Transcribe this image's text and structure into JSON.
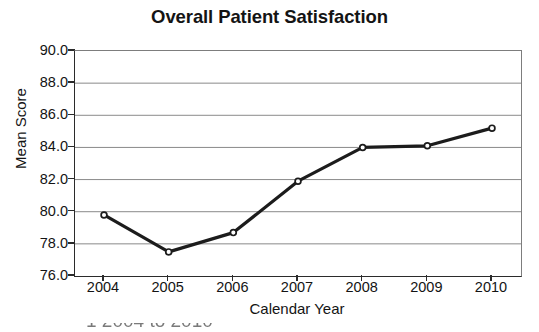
{
  "chart_data": {
    "type": "line",
    "title": "Overall Patient Satisfaction",
    "xlabel": "Calendar Year",
    "ylabel": "Mean Score",
    "categories": [
      "2004",
      "2005",
      "2006",
      "2007",
      "2008",
      "2009",
      "2010"
    ],
    "x": [
      2004,
      2005,
      2006,
      2007,
      2008,
      2009,
      2010
    ],
    "values": [
      79.8,
      77.5,
      78.7,
      81.9,
      84.0,
      84.1,
      85.2
    ],
    "series": [
      {
        "name": "Mean Score",
        "values": [
          79.8,
          77.5,
          78.7,
          81.9,
          84.0,
          84.1,
          85.2
        ]
      }
    ],
    "ylim": [
      76.0,
      90.0
    ],
    "ytick_labels": [
      "90.0",
      "88.0",
      "86.0",
      "84.0",
      "82.0",
      "80.0",
      "78.0",
      "76.0"
    ],
    "ytick_values": [
      90.0,
      88.0,
      86.0,
      84.0,
      82.0,
      80.0,
      78.0,
      76.0
    ],
    "xtick_labels": [
      "2004",
      "2005",
      "2006",
      "2007",
      "2008",
      "2009",
      "2010"
    ],
    "grid": "horizontal",
    "legend": "none",
    "line_color": "#1c1c1c",
    "marker": "open-circle",
    "grid_color": "#8a8a8a",
    "axis_color": "#2b2b2b"
  },
  "footer": {
    "cropped_text": "1      2004 to 2010"
  }
}
